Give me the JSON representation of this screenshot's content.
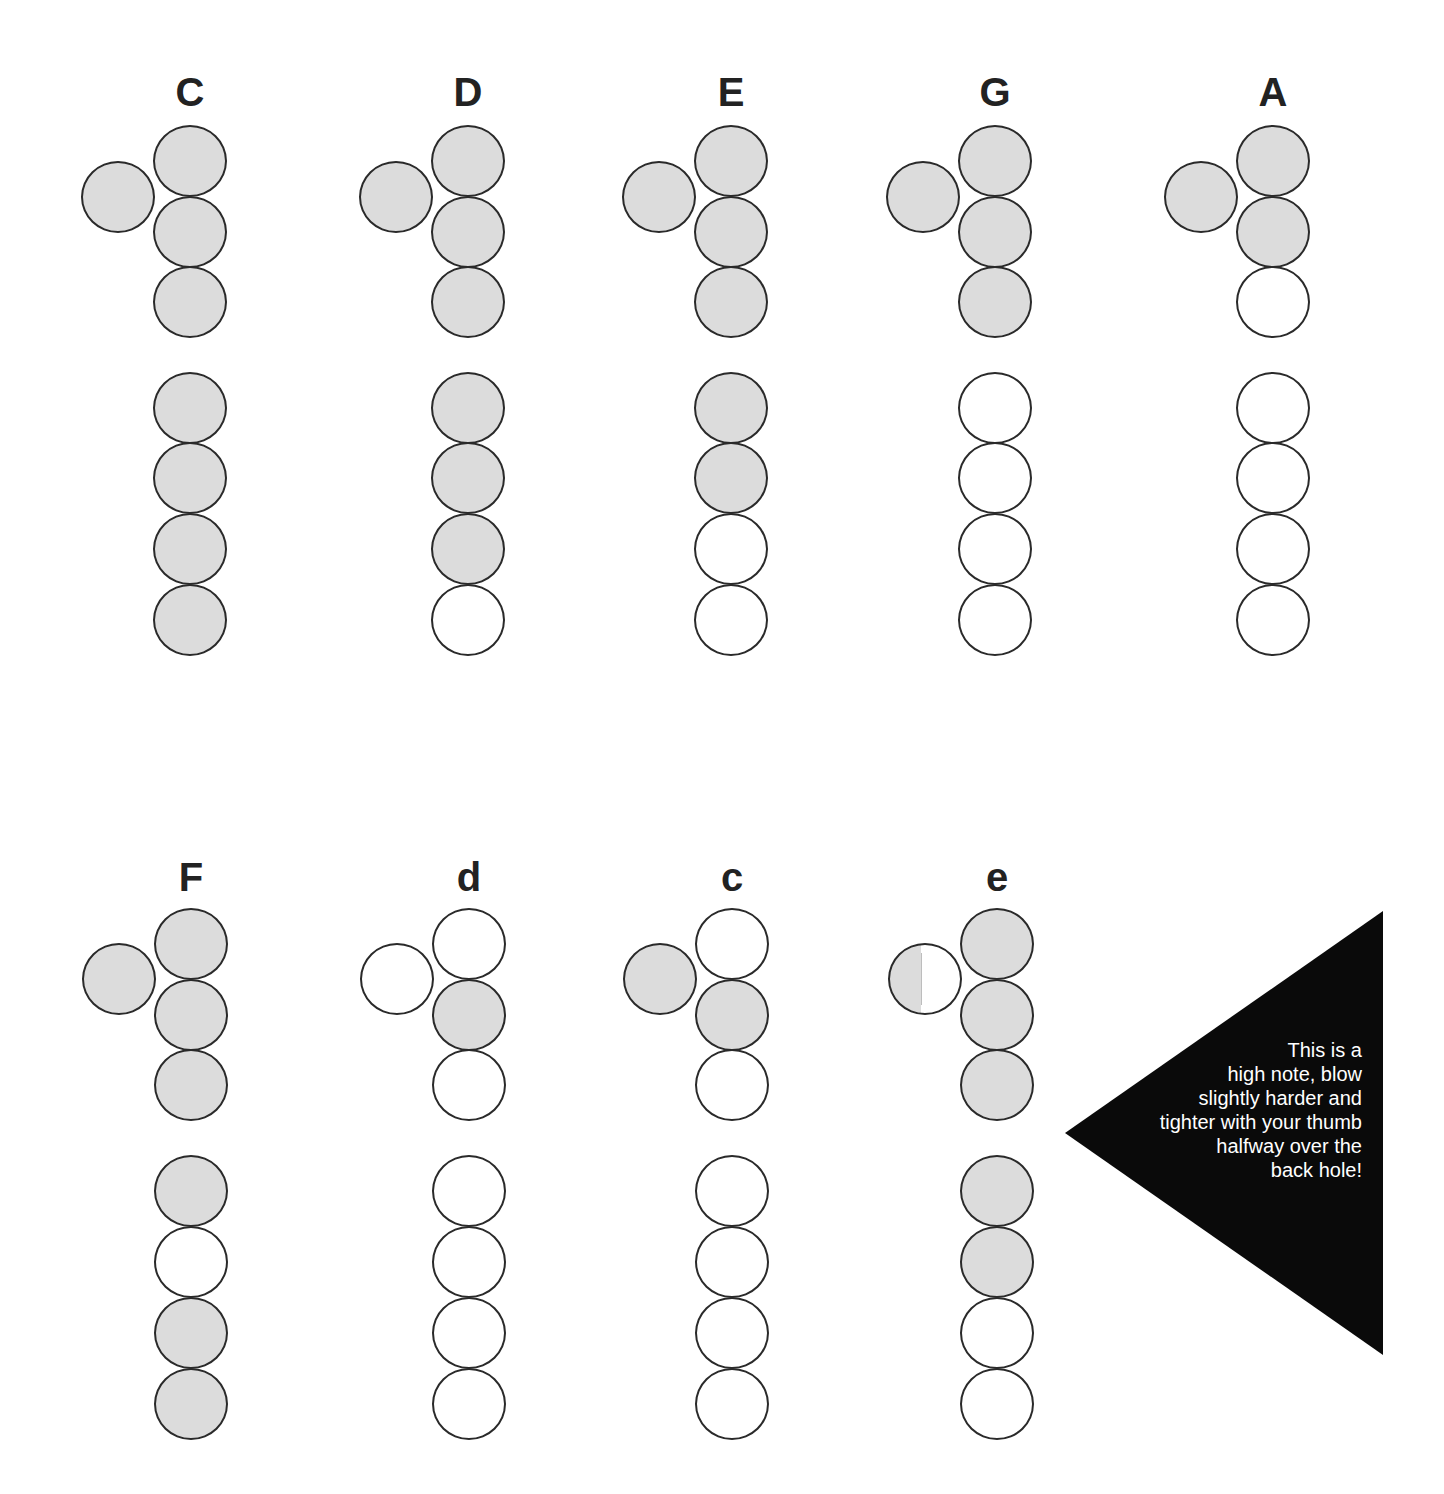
{
  "colors": {
    "closed_fill": "#dcdcdc",
    "open_fill": "#ffffff",
    "outline": "#2a2a2a",
    "label": "#222222",
    "callout_bg": "#0a0a0a",
    "callout_text": "#ffffff"
  },
  "legend": {
    "closed": "shaded hole = covered",
    "open": "white hole = uncovered",
    "half": "half-shaded hole = half covered"
  },
  "fingerings": [
    {
      "note": "C",
      "row": "top",
      "x": 190,
      "thumb": "closed",
      "holes": [
        "closed",
        "closed",
        "closed",
        "closed",
        "closed",
        "closed",
        "closed"
      ]
    },
    {
      "note": "D",
      "row": "top",
      "x": 468,
      "thumb": "closed",
      "holes": [
        "closed",
        "closed",
        "closed",
        "closed",
        "closed",
        "closed",
        "open"
      ]
    },
    {
      "note": "E",
      "row": "top",
      "x": 731,
      "thumb": "closed",
      "holes": [
        "closed",
        "closed",
        "closed",
        "closed",
        "closed",
        "open",
        "open"
      ]
    },
    {
      "note": "G",
      "row": "top",
      "x": 995,
      "thumb": "closed",
      "holes": [
        "closed",
        "closed",
        "closed",
        "open",
        "open",
        "open",
        "open"
      ]
    },
    {
      "note": "A",
      "row": "top",
      "x": 1273,
      "thumb": "closed",
      "holes": [
        "closed",
        "closed",
        "open",
        "open",
        "open",
        "open",
        "open"
      ]
    },
    {
      "note": "F",
      "row": "bottom",
      "x": 191,
      "thumb": "closed",
      "holes": [
        "closed",
        "closed",
        "closed",
        "closed",
        "open",
        "closed",
        "closed"
      ]
    },
    {
      "note": "d",
      "row": "bottom",
      "x": 469,
      "thumb": "open",
      "holes": [
        "open",
        "closed",
        "open",
        "open",
        "open",
        "open",
        "open"
      ]
    },
    {
      "note": "c",
      "row": "bottom",
      "x": 732,
      "thumb": "closed",
      "holes": [
        "open",
        "closed",
        "open",
        "open",
        "open",
        "open",
        "open"
      ]
    },
    {
      "note": "e",
      "row": "bottom",
      "x": 997,
      "thumb": "half",
      "holes": [
        "closed",
        "closed",
        "closed",
        "closed",
        "closed",
        "open",
        "open"
      ]
    }
  ],
  "callout": {
    "lines": [
      "This is a",
      "high note, blow",
      "slightly harder and",
      "tighter with your thumb",
      "halfway over the",
      "back hole!"
    ],
    "points": "1065,1133 1383,911 1383,1355"
  }
}
